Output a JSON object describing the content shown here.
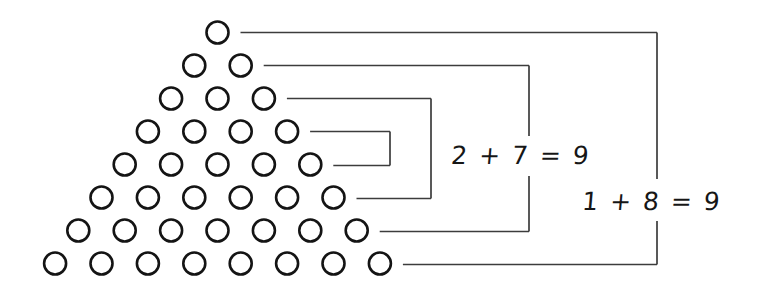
{
  "canvas": {
    "background": "#ffffff"
  },
  "colors": {
    "dot_stroke": "#141414",
    "dot_fill": "#ffffff",
    "line": "#3c3c3c",
    "text": "#161616"
  },
  "triangle": {
    "rows": 8,
    "dot_counts_per_row": [
      1,
      2,
      3,
      4,
      5,
      6,
      7,
      8
    ]
  },
  "pairs": [
    {
      "top_row": 1,
      "bottom_row": 8,
      "label": "1 + 8 = 9"
    },
    {
      "top_row": 2,
      "bottom_row": 7,
      "label": "2 + 7 = 9"
    },
    {
      "top_row": 3,
      "bottom_row": 6,
      "label": ""
    },
    {
      "top_row": 4,
      "bottom_row": 5,
      "label": ""
    }
  ],
  "equations": [
    {
      "text": "2 + 7 = 9"
    },
    {
      "text": "1 + 8 = 9"
    }
  ]
}
